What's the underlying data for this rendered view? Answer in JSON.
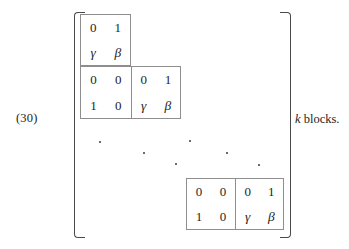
{
  "equation": {
    "tag": "(30)",
    "annotation_variable": "k",
    "annotation_text": "blocks."
  },
  "blocks": [
    {
      "id": "block-row1",
      "subblocks": [
        {
          "name": "companion-block",
          "cells": [
            "0",
            "1",
            "γ",
            "β"
          ]
        }
      ]
    },
    {
      "id": "block-row2",
      "subblocks": [
        {
          "name": "coupling-block",
          "cells": [
            "0",
            "0",
            "1",
            "0"
          ]
        },
        {
          "name": "companion-block",
          "cells": [
            "0",
            "1",
            "γ",
            "β"
          ]
        }
      ]
    },
    {
      "id": "block-rowk",
      "subblocks": [
        {
          "name": "coupling-block",
          "cells": [
            "0",
            "0",
            "1",
            "0"
          ]
        },
        {
          "name": "companion-block",
          "cells": [
            "0",
            "1",
            "γ",
            "β"
          ]
        }
      ]
    }
  ],
  "ellipsis_dots": [
    {
      "x": 99,
      "y": 141
    },
    {
      "x": 143,
      "y": 152
    },
    {
      "x": 175,
      "y": 163
    },
    {
      "x": 189,
      "y": 140
    },
    {
      "x": 226,
      "y": 152
    },
    {
      "x": 258,
      "y": 164
    }
  ],
  "colors": {
    "background": "#ffffff",
    "text": "#1d1d1d",
    "rule": "#8e8e8e",
    "bracket": "#4a4a4a"
  }
}
